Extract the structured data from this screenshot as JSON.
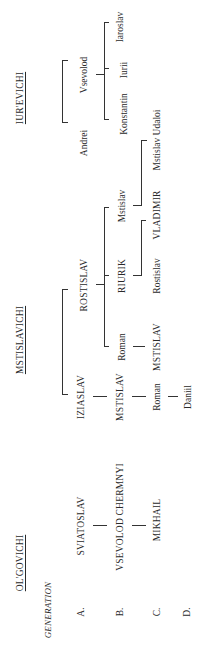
{
  "diagram": {
    "orientation": "rotated 90 degrees counter-clockwise",
    "generation_label": "GENERATION",
    "generations": [
      "A.",
      "B.",
      "C.",
      "D."
    ],
    "families": [
      {
        "name": "OL'GOVICHI"
      },
      {
        "name": "MSTISLAVICHI"
      },
      {
        "name": "IUR'EVICHI"
      }
    ],
    "people": {
      "olg_a": "SVIATOSLAV",
      "olg_b": "VSEVOLOD CHERMNYI",
      "olg_c": "MIKHAIL",
      "mst_iziaslav": "IZIASLAV",
      "mst_rostislav": "ROSTISLAV",
      "mst_b_mstislav": "MSTISLAV",
      "mst_b_roman": "Roman",
      "mst_b_riurik": "RIURIK",
      "mst_b_mstislav2": "Mstislav",
      "mst_c_roman": "Roman",
      "mst_c_mstislav": "MSTISLAV",
      "mst_c_rostislav": "Rostislav",
      "mst_c_vladimir": "VLADIMIR",
      "mst_c_udaloi": "Mstislav Udaloi",
      "mst_d_daniil": "Daniil",
      "iur_andrei": "Andrei",
      "iur_vsevolod": "Vsevolod",
      "iur_konstantin": "Konstantin",
      "iur_iurii": "Iurii",
      "iur_iaroslav": "Iaroslav"
    }
  }
}
